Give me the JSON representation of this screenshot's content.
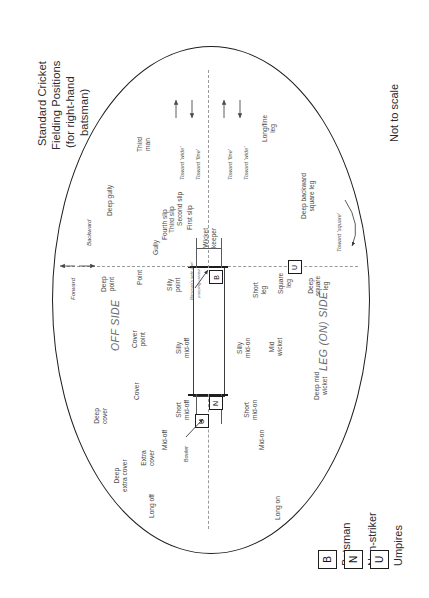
{
  "title": {
    "line1": "Standard Cricket",
    "line2": "Fielding Positions",
    "line3": "(for right-hand",
    "line4": "batsman)"
  },
  "note": "Not to scale",
  "side_labels": {
    "off": "OFF SIDE",
    "leg": "LEG (ON) SIDE"
  },
  "axis_labels": {
    "forward": "Forward",
    "backward": "Backward"
  },
  "direction_labels": [
    "Toward 'wide'",
    "Toward 'fine'",
    "Toward 'fine'",
    "Toward 'wide'",
    "Toward 'square'"
  ],
  "pitch_annotation": {
    "line1": "Batsman's safe line/",
    "line2": "popping crease"
  },
  "bowler_label": "Bowler",
  "markers": {
    "batsman": "B",
    "nonstriker": "N",
    "umpire": "U"
  },
  "legend": {
    "items": [
      {
        "symbol": "B",
        "label": "Batsman"
      },
      {
        "symbol": "N",
        "label": "Non-striker"
      },
      {
        "symbol": "U",
        "label": "Umpires"
      }
    ]
  },
  "positions": {
    "off_side": [
      "Third man",
      "Deep gully",
      "Gully",
      "Fourth slip",
      "Third slip",
      "Second slip",
      "First slip",
      "Wicket keeper",
      "Deep point",
      "Point",
      "Silly point",
      "Cover point",
      "Cover",
      "Deep cover",
      "Extra cover",
      "Mid-off",
      "Silly mid-off",
      "Short mid-off",
      "Deep extra cover",
      "Long off"
    ],
    "leg_side": [
      "Long/fine leg",
      "Deep backward square leg",
      "Short leg",
      "Square leg",
      "Deep square leg",
      "Silly mid-on",
      "Mid wicket",
      "Deep mid wicket",
      "Short mid-on",
      "Mid-on",
      "Long on"
    ]
  },
  "labels": {
    "third_man": "Third\nman",
    "deep_gully": "Deep gully",
    "gully": "Gully",
    "fourth_slip": "Fourth slip",
    "third_slip": "Third slip",
    "second_slip": "Second slip",
    "first_slip": "First slip",
    "wicket_keeper": "Wicket\nkeeper",
    "deep_point": "Deep\npoint",
    "point": "Point",
    "silly_point": "Silly\npoint",
    "cover_point": "Cover\npoint",
    "cover": "Cover",
    "deep_cover": "Deep\ncover",
    "extra_cover": "Extra\ncover",
    "mid_off": "Mid-off",
    "silly_mid_off": "Silly\nmid-off",
    "short_mid_off": "Short\nmid-off",
    "deep_extra_cover": "Deep\nextra cover",
    "long_off": "Long off",
    "long_fine_leg": "Long/fine\nleg",
    "deep_backward_square_leg": "Deep backward\nsquare leg",
    "short_leg": "Short\nleg",
    "square_leg": "Square\nleg",
    "deep_square_leg": "Deep\nsquare\nleg",
    "silly_mid_on": "Silly\nmid-on",
    "mid_wicket": "Mid\nwicket",
    "deep_mid_wicket": "Deep mid\nwicket",
    "short_mid_on": "Short\nmid-on",
    "mid_on": "Mid-on",
    "long_on": "Long on"
  },
  "colors": {
    "boundary": "#1d1d1d",
    "text": "#3a3a3a",
    "muted": "#6a6a6a",
    "dash": "#9a9a9a",
    "background": "#ffffff"
  }
}
